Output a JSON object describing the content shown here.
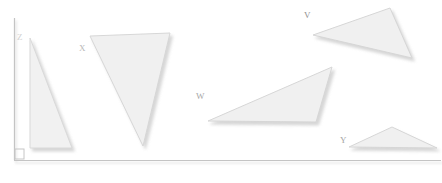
{
  "figure": {
    "background_color": "#ffffff",
    "axis": {
      "name": "coordinate-axes",
      "line_color": "#c8c8c8",
      "shadow_color": "#e2e2e2",
      "vertical": {
        "x": 14,
        "y_top": 18,
        "y_bottom": 160
      },
      "horizontal": {
        "y": 160,
        "x_left": 14,
        "x_right": 441
      },
      "right_angle_marker": {
        "x": 14,
        "y": 150,
        "size": 10,
        "color": "#c0c0c0"
      }
    },
    "shape_style": {
      "fill": "#f1f1f1",
      "stroke": "#d8d8d8",
      "shadow": "#e6e6e6"
    },
    "shapes": [
      {
        "id": "triangle-z",
        "label": "Z",
        "label_color": "#d2d2d2",
        "label_x": 17,
        "label_y": 33,
        "points": "30,38 30,148 72,148",
        "fill": "#f1f1f1",
        "stroke": "#d9d9d9"
      },
      {
        "id": "triangle-x",
        "label": "X",
        "label_color": "#b8b8b8",
        "label_x": 79,
        "label_y": 44,
        "points": "90,36 170,33 143,146",
        "fill": "#f0f0f0",
        "stroke": "#d7d7d7"
      },
      {
        "id": "triangle-w",
        "label": "W",
        "label_color": "#a8a8a8",
        "label_x": 196,
        "label_y": 92,
        "points": "208,121 332,67 316,122",
        "fill": "#f0f0f0",
        "stroke": "#d6d6d6"
      },
      {
        "id": "triangle-v",
        "label": "V",
        "label_color": "#8f8f8f",
        "label_x": 304,
        "label_y": 11,
        "points": "313,35 390,8 412,58",
        "fill": "#f0f0f0",
        "stroke": "#d6d6d6"
      },
      {
        "id": "triangle-y",
        "label": "Y",
        "label_color": "#a5a5a5",
        "label_x": 340,
        "label_y": 136,
        "points": "349,147 392,127 437,148",
        "fill": "#f0f0f0",
        "stroke": "#d6d6d6"
      }
    ]
  }
}
